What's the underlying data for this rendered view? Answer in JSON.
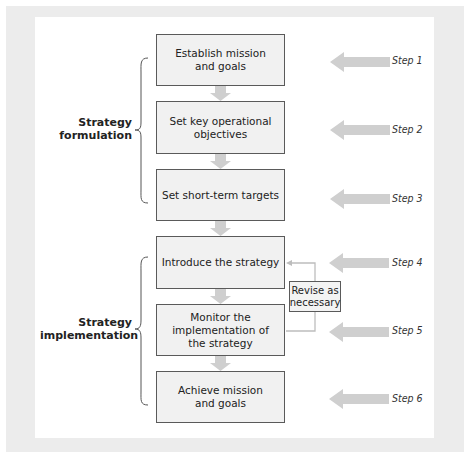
{
  "diagram": {
    "type": "flowchart",
    "colors": {
      "frame": "#ececec",
      "panel": "#ffffff",
      "box_fill": "#f1f1f1",
      "box_border": "#5a5a5a",
      "arrow": "#cfcfcf",
      "feedback_line": "#bdbdbd"
    },
    "groups": [
      {
        "label": "Strategy\nformulation",
        "steps": [
          1,
          2,
          3
        ]
      },
      {
        "label": "Strategy\nimplementation",
        "steps": [
          4,
          5,
          6
        ]
      }
    ],
    "boxes": [
      {
        "step": 1,
        "text": "Establish mission\nand goals"
      },
      {
        "step": 2,
        "text": "Set key operational\nobjectives"
      },
      {
        "step": 3,
        "text": "Set short-term targets"
      },
      {
        "step": 4,
        "text": "Introduce the strategy"
      },
      {
        "step": 5,
        "text": "Monitor the\nimplementation of\nthe strategy"
      },
      {
        "step": 6,
        "text": "Achieve mission\nand goals"
      }
    ],
    "step_labels": [
      "Step 1",
      "Step 2",
      "Step 3",
      "Step 4",
      "Step 5",
      "Step 6"
    ],
    "feedback": {
      "label": "Revise as\nnecessary",
      "from_step": 5,
      "to_step": 4
    }
  }
}
